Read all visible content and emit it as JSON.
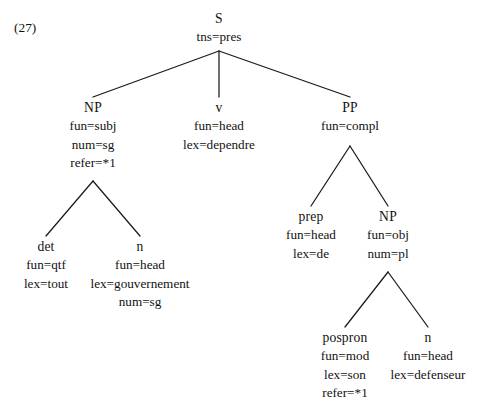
{
  "figure": {
    "example_label": "(27)",
    "line_color": "#1a1a1a",
    "text_color": "#121212",
    "background_color": "#ffffff"
  },
  "tree": {
    "root": {
      "head": "S",
      "attrs": [
        "tns=pres"
      ]
    },
    "np_subject": {
      "head": "NP",
      "attrs": [
        "fun=subj",
        "num=sg",
        "refer=*1"
      ]
    },
    "verb": {
      "head": "v",
      "attrs": [
        "fun=head",
        "lex=dependre"
      ]
    },
    "pp": {
      "head": "PP",
      "attrs": [
        "fun=compl"
      ]
    },
    "det": {
      "head": "det",
      "attrs": [
        "fun=qtf",
        "lex=tout"
      ]
    },
    "noun_subject": {
      "head": "n",
      "attrs": [
        "fun=head",
        "lex=gouvernement",
        "num=sg"
      ]
    },
    "prep": {
      "head": "prep",
      "attrs": [
        "fun=head",
        "lex=de"
      ]
    },
    "np_object": {
      "head": "NP",
      "attrs": [
        "fun=obj",
        "num=pl"
      ]
    },
    "pospron": {
      "head": "pospron",
      "attrs": [
        "fun=mod",
        "lex=son",
        "refer=*1"
      ]
    },
    "noun_object": {
      "head": "n",
      "attrs": [
        "fun=head",
        "lex=defenseur"
      ]
    }
  }
}
